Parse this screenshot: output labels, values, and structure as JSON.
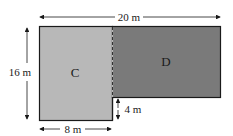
{
  "diagram": {
    "regions": [
      {
        "label": "C",
        "fill": "#b8b8b8"
      },
      {
        "label": "D",
        "fill": "#7a7a7a"
      }
    ],
    "dimensions": {
      "total_width": "20 m",
      "total_height": "16 m",
      "bottom_width": "8 m",
      "step_height": "4 m"
    },
    "outline_color": "#1a1a1a"
  }
}
